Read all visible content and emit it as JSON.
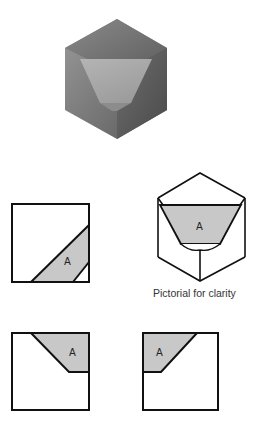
{
  "figure": {
    "shaded_cube": {
      "description": "3D shaded cube with truncated corner face"
    },
    "views": [
      {
        "id": "view-top-left",
        "face_label": "A"
      },
      {
        "id": "pictorial",
        "face_label": "A",
        "caption": "Pictorial for clarity"
      },
      {
        "id": "view-bottom-left",
        "face_label": "A"
      },
      {
        "id": "view-bottom-right",
        "face_label": "A"
      }
    ]
  },
  "colors": {
    "shade": "#c8c8c8",
    "line": "#111111",
    "background": "#ffffff"
  }
}
